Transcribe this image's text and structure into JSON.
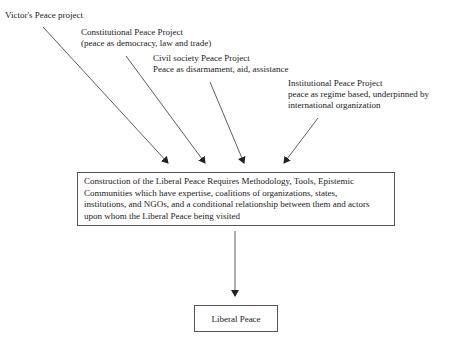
{
  "diagram": {
    "sources": [
      {
        "id": "victors",
        "title": "Victor's Peace project",
        "desc": ""
      },
      {
        "id": "constitutional",
        "title": "Constitutional Peace Project",
        "desc": "(peace as democracy, law and trade)"
      },
      {
        "id": "civil",
        "title": "Civil society Peace Project",
        "desc": "Peace as disarmament, aid, assistance"
      },
      {
        "id": "institutional",
        "title": "Institutional Peace Project",
        "desc1": "peace as regime based, underpinned by",
        "desc2": "international organization"
      }
    ],
    "middle": {
      "line1": "Construction of the Liberal Peace Requires Methodology, Tools, Epistemic",
      "line2": "Communities which have expertise, coalitions of organizations, states,",
      "line3": "institutions, and NGOs, and a conditional relationship between them and actors",
      "line4": "upon whom the Liberal Peace being visited"
    },
    "result": {
      "label": "Liberal Peace"
    },
    "edges": [
      {
        "from": "victors",
        "to": "middle"
      },
      {
        "from": "constitutional",
        "to": "middle"
      },
      {
        "from": "civil",
        "to": "middle"
      },
      {
        "from": "institutional",
        "to": "middle"
      },
      {
        "from": "middle",
        "to": "result"
      }
    ],
    "colors": {
      "line": "#333333",
      "border": "#555555",
      "text": "#222222"
    }
  }
}
